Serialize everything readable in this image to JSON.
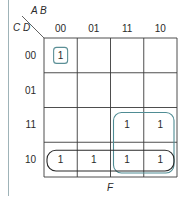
{
  "kmap": {
    "row_variables": "C D",
    "col_variables": "A B",
    "col_labels": [
      "00",
      "01",
      "11",
      "10"
    ],
    "row_labels": [
      "00",
      "01",
      "11",
      "10"
    ],
    "cells": [
      [
        "1",
        "",
        "",
        ""
      ],
      [
        "",
        "",
        "",
        ""
      ],
      [
        "",
        "",
        "1",
        "1"
      ],
      [
        "1",
        "1",
        "1",
        "1"
      ]
    ],
    "groups": [
      {
        "name": "group-single-0000",
        "rows": [
          0,
          0
        ],
        "cols": [
          0,
          0
        ],
        "color": "#5b8f96"
      },
      {
        "name": "group-right-square",
        "rows": [
          2,
          3
        ],
        "cols": [
          2,
          3
        ],
        "color": "#4f8c94"
      },
      {
        "name": "group-bottom-row",
        "rows": [
          3,
          3
        ],
        "cols": [
          0,
          3
        ],
        "color": "#2a2a2a"
      }
    ],
    "function_label": "F"
  },
  "colors": {
    "grid": "#3a3a3a",
    "group_teal": "#4f8c94",
    "group_dark": "#2a2a2a",
    "left_rule": "#9fb3b8"
  }
}
